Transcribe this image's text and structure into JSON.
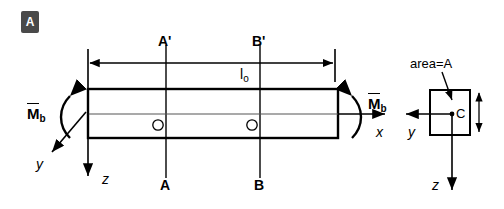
{
  "figure": {
    "panel_label": "A"
  },
  "beam": {
    "span_label": "l",
    "span_label_sub": "o",
    "section_top_labels": [
      "A'",
      "B'"
    ],
    "section_bottom_labels": [
      "A",
      "B"
    ],
    "centroid_marks": [
      "O",
      "O"
    ],
    "moment_left": {
      "symbol": "M",
      "sub": "b"
    },
    "moment_right": {
      "symbol": "M",
      "sub": "b"
    },
    "axes": {
      "x": "x",
      "y": "y",
      "z": "z"
    }
  },
  "cross_section": {
    "area_label": "area=A",
    "centroid_label": "C",
    "axes": {
      "y": "y",
      "z": "z"
    }
  },
  "colors": {
    "stroke": "#000000",
    "centerline": "#555555",
    "badge_bg": "#4a4a4a",
    "badge_fg": "#ffffff",
    "background": "#ffffff"
  }
}
